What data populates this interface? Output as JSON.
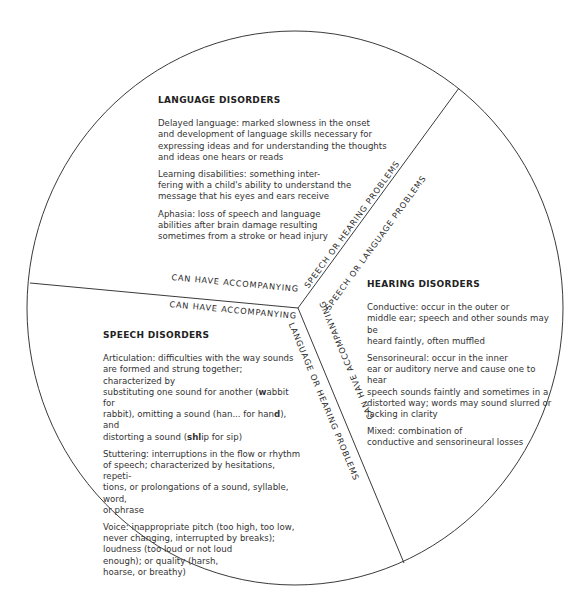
{
  "sections": {
    "language": {
      "title": "LANGUAGE DISORDERS",
      "items": [
        "Delayed language: marked slowness in the onset\nand development of language skills necessary for\nexpressing ideas and for understanding the thoughts\nand ideas one hears or reads",
        "Learning disabilities: something inter-\nfering with a child's ability to understand the\nmessage that his eyes and ears receive",
        "Aphasia: loss of speech and language\nabilities after brain damage resulting\nsometimes from a stroke or head injury"
      ]
    },
    "hearing": {
      "title": "HEARING DISORDERS",
      "items": [
        "Conductive: occur in the outer or\nmiddle ear; speech and other sounds may be\nheard faintly, often muffled",
        "Sensorineural: occur in the inner\near or auditory nerve and cause one to hear\nspeech sounds faintly and sometimes in a\ndistorted way; words may sound slurred or\nlacking in clarity",
        "Mixed: combination of\nconductive and sensorineural losses"
      ]
    },
    "speech": {
      "title": "SPEECH DISORDERS",
      "items": [
        "Articulation: difficulties with the way sounds\nare formed and strung together; characterized by\nsubstituting one sound for another (wabbit for\nrabbit), omitting a sound (han... for hand), and\ndistorting a sound (shlip for sip)",
        "Stuttering: interruptions in the flow or rhythm\nof speech; characterized by hesitations, repeti-\ntions, or prolongations of a sound, syllable, word,\nor phrase",
        "Voice: inappropriate pitch (too high, too low,\nnever changing, interrupted by breaks);\nloudness (too loud or not loud\nenough); or quality (harsh,\nhoarse, or breathy)"
      ]
    }
  },
  "divider_labels": {
    "left_above": "CAN HAVE ACCOMPANYING",
    "left_below": "CAN HAVE ACCOMPANYING",
    "upper_left_side": "SPEECH OR HEARING PROBLEMS",
    "upper_right_side": "SPEECH OR LANGUAGE PROBLEMS",
    "lower_right_side": "CAN HAVE ACCOMPANYING",
    "lower_left_side": "LANGUAGE OR HEARING PROBLEMS"
  },
  "colors": {
    "line": "#3a3a3a",
    "text": "#2a2a2a"
  }
}
